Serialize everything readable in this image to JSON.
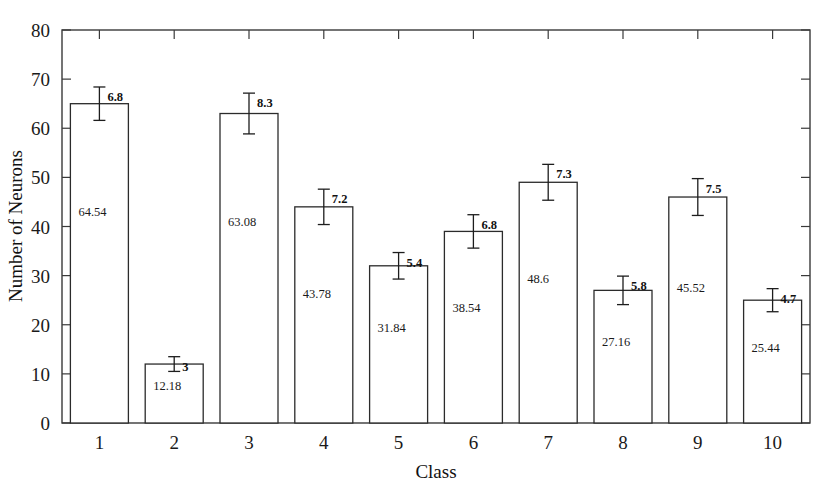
{
  "chart_data": {
    "type": "bar",
    "title": "",
    "xlabel": "Class",
    "ylabel": "Number of Neurons",
    "categories": [
      "1",
      "2",
      "3",
      "4",
      "5",
      "6",
      "7",
      "8",
      "9",
      "10"
    ],
    "values": [
      65,
      12,
      63,
      44,
      32,
      39,
      49,
      27,
      46,
      25
    ],
    "value_labels": [
      "64.54",
      "12.18",
      "63.08",
      "43.78",
      "31.84",
      "38.54",
      "48.6",
      "27.16",
      "45.52",
      "25.44"
    ],
    "errors": [
      6.8,
      3,
      8.3,
      7.2,
      5.4,
      6.8,
      7.3,
      5.8,
      7.5,
      4.7
    ],
    "error_labels": [
      "6.8",
      "3",
      "8.3",
      "7.2",
      "5.4",
      "6.8",
      "7.3",
      "5.8",
      "7.5",
      "4.7"
    ],
    "ylim": [
      0,
      80
    ],
    "ytick_values": [
      0,
      10,
      20,
      30,
      40,
      50,
      60,
      70,
      80
    ],
    "ytick_labels": [
      "0",
      "10",
      "20",
      "30",
      "40",
      "50",
      "60",
      "70",
      "80"
    ],
    "grid": false,
    "legend": null,
    "bar_fill_color": "#ffffff",
    "bar_edge_color": "#2b2b2b",
    "axis_color": "#3a3a3a"
  },
  "plot": {
    "left": 62,
    "right": 810,
    "top": 30,
    "bottom": 423,
    "bar_width": 58
  },
  "labels": {
    "xaxis_title": "Class",
    "yaxis_title": "Number of Neurons"
  }
}
